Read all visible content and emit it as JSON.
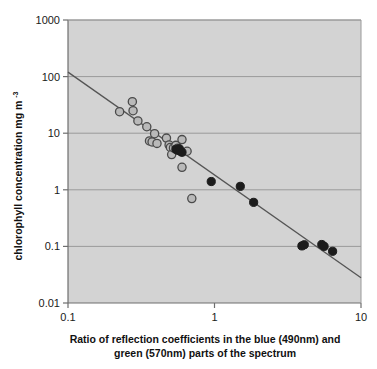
{
  "chart_data": {
    "type": "scatter",
    "title": "",
    "xlabel_line1": "Ratio of reflection coefficients in the blue (490nm) and",
    "xlabel_line2": "green (570nm) parts of the spectrum",
    "ylabel": "chlorophyll concentration mg m",
    "ylabel_superscript": "-3",
    "xscale": "log",
    "yscale": "log",
    "xlim": [
      0.1,
      10
    ],
    "ylim": [
      0.01,
      1000
    ],
    "xticks": [
      "0.1",
      "1",
      "10"
    ],
    "xtick_values": [
      0.1,
      1,
      10
    ],
    "yticks": [
      "0.01",
      "0.1",
      "1",
      "10",
      "100",
      "1000"
    ],
    "ytick_values": [
      0.01,
      0.1,
      1,
      10,
      100,
      1000
    ],
    "grid": "horizontal",
    "legend": "none",
    "plot_background": "#d3d3d3",
    "gridline_color": "#9a9a9a",
    "axis_color": "#8a8a8a",
    "series": [
      {
        "name": "open-circles",
        "marker": "open-circle",
        "fill": "#b9b9b9",
        "stroke": "#4a4a4a",
        "points": [
          [
            0.225,
            24.0
          ],
          [
            0.275,
            36.0
          ],
          [
            0.278,
            25.0
          ],
          [
            0.3,
            16.5
          ],
          [
            0.345,
            13.0
          ],
          [
            0.36,
            7.3
          ],
          [
            0.375,
            7.0
          ],
          [
            0.39,
            9.8
          ],
          [
            0.405,
            6.6
          ],
          [
            0.47,
            8.2
          ],
          [
            0.49,
            6.2
          ],
          [
            0.5,
            5.6
          ],
          [
            0.51,
            4.2
          ],
          [
            0.525,
            5.5
          ],
          [
            0.545,
            6.1
          ],
          [
            0.56,
            5.4
          ],
          [
            0.6,
            7.7
          ],
          [
            0.6,
            2.5
          ],
          [
            0.65,
            4.8
          ],
          [
            0.7,
            0.7
          ]
        ]
      },
      {
        "name": "filled-circles",
        "marker": "filled-circle",
        "fill": "#1c1c1c",
        "stroke": "#1c1c1c",
        "points": [
          [
            0.545,
            5.2
          ],
          [
            0.56,
            5.0
          ],
          [
            0.575,
            5.3
          ],
          [
            0.585,
            4.8
          ],
          [
            0.6,
            4.6
          ],
          [
            0.95,
            1.4
          ],
          [
            1.5,
            1.15
          ],
          [
            1.85,
            0.6
          ],
          [
            3.95,
            0.102
          ],
          [
            4.1,
            0.107
          ],
          [
            5.4,
            0.108
          ],
          [
            5.6,
            0.1
          ],
          [
            6.4,
            0.082
          ]
        ]
      }
    ],
    "trendline": {
      "name": "regression-line",
      "color": "#555555",
      "x_start": 0.1,
      "y_start": 120,
      "x_end": 10,
      "y_end": 0.028
    }
  }
}
